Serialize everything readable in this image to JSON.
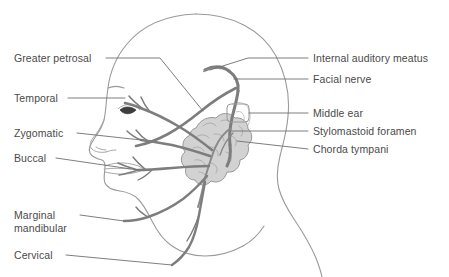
{
  "figure": {
    "background_color": "#ffffff",
    "line_color": "#6f6f6f",
    "outline_color": "#8a8a8a",
    "nerve_color": "#7d7d7d",
    "gland_fill": "#d0d0d0",
    "text_color": "#4a4a4a"
  },
  "labels_left": [
    {
      "id": "greater-petrosal",
      "text": "Greater petrosal"
    },
    {
      "id": "temporal",
      "text": "Temporal"
    },
    {
      "id": "zygomatic",
      "text": "Zygomatic"
    },
    {
      "id": "buccal",
      "text": "Buccal"
    },
    {
      "id": "marginal-mandibular-line1",
      "text": "Marginal"
    },
    {
      "id": "marginal-mandibular-line2",
      "text": "mandibular"
    },
    {
      "id": "cervical",
      "text": "Cervical"
    }
  ],
  "labels_right": [
    {
      "id": "internal-auditory-meatus",
      "text": "Internal auditory meatus"
    },
    {
      "id": "facial-nerve",
      "text": "Facial nerve"
    },
    {
      "id": "middle-ear",
      "text": "Middle ear"
    },
    {
      "id": "stylomastoid-foramen",
      "text": "Stylomastoid foramen"
    },
    {
      "id": "chorda-tympani",
      "text": "Chorda tympani"
    }
  ]
}
